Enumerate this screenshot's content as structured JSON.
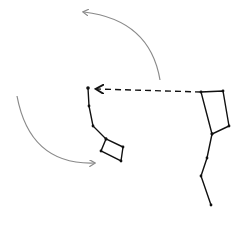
{
  "diagram": {
    "colors": {
      "stars": "#111111",
      "lines": "#111111",
      "arcs": "#8a8a8a",
      "background": "#ffffff"
    },
    "little_dipper": {
      "points": [
        [
          88,
          88
        ],
        [
          89,
          106
        ],
        [
          93,
          126
        ],
        [
          106,
          139
        ],
        [
          123,
          147
        ],
        [
          121,
          161
        ],
        [
          101,
          151
        ],
        [
          106,
          139
        ]
      ]
    },
    "big_dipper": {
      "points": [
        [
          211,
          205
        ],
        [
          201,
          176
        ],
        [
          207,
          158
        ],
        [
          212,
          134
        ],
        [
          229,
          126
        ],
        [
          223,
          91
        ],
        [
          201,
          92
        ],
        [
          212,
          134
        ]
      ]
    },
    "pointer_arrow": {
      "from": [
        201,
        92
      ],
      "to": [
        97,
        89
      ],
      "style": "dashed"
    },
    "rotation_arcs": [
      {
        "path": "M160,80 Q150,20 84,12",
        "arrow_at": "end"
      },
      {
        "path": "M17,96 Q30,165 94,163",
        "arrow_at": "end"
      }
    ]
  }
}
